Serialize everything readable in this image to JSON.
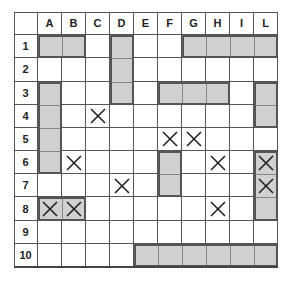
{
  "grid": {
    "columns": [
      "A",
      "B",
      "C",
      "D",
      "E",
      "F",
      "G",
      "H",
      "I",
      "L"
    ],
    "rows": [
      "1",
      "2",
      "3",
      "4",
      "5",
      "6",
      "7",
      "8",
      "9",
      "10"
    ],
    "colors": {
      "ship_fill": "#d0d0d0",
      "ship_border": "#555555",
      "grid_line": "#555555",
      "mark": "#222222"
    }
  },
  "ships": [
    {
      "start": "A1",
      "end": "B1"
    },
    {
      "start": "D1",
      "end": "D3"
    },
    {
      "start": "G1",
      "end": "L1"
    },
    {
      "start": "A3",
      "end": "A6"
    },
    {
      "start": "F3",
      "end": "H3"
    },
    {
      "start": "L3",
      "end": "L4"
    },
    {
      "start": "F6",
      "end": "F7"
    },
    {
      "start": "L6",
      "end": "L8"
    },
    {
      "start": "A8",
      "end": "B8"
    },
    {
      "start": "E10",
      "end": "L10"
    }
  ],
  "marks": [
    "C4",
    "F5",
    "G5",
    "B6",
    "H6",
    "L6",
    "D7",
    "L7",
    "A8",
    "B8",
    "H8"
  ],
  "mark_icon": "x-mark-icon"
}
